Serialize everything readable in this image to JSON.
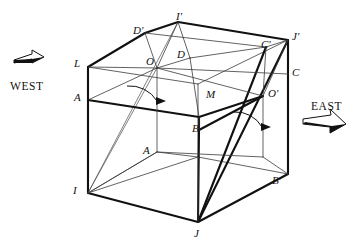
{
  "figure": {
    "type": "geometric-line-diagram",
    "background_color": "#ffffff",
    "stroke_color": "#111111"
  },
  "direction_markers": [
    {
      "id": "west",
      "label": "WEST",
      "icon": "arrow-right-3d",
      "x": 10,
      "y": 81,
      "arrow_x": 14,
      "arrow_y": 56,
      "arrow_dir": "right"
    },
    {
      "id": "east",
      "label": "EAST",
      "icon": "arrow-down-right-3d",
      "x": 311,
      "y": 101,
      "arrow_x": 303,
      "arrow_y": 118,
      "arrow_dir": "down-right"
    }
  ],
  "vertex_labels": [
    {
      "id": "D-prime",
      "text": "D'",
      "x": 133,
      "y": 25
    },
    {
      "id": "I-prime",
      "text": "I'",
      "x": 176,
      "y": 11
    },
    {
      "id": "J-prime",
      "text": "J'",
      "x": 292,
      "y": 31
    },
    {
      "id": "C-prime",
      "text": "C'",
      "x": 261,
      "y": 39
    },
    {
      "id": "D",
      "text": "D",
      "x": 177,
      "y": 49
    },
    {
      "id": "O",
      "text": "O",
      "x": 146,
      "y": 56
    },
    {
      "id": "L",
      "text": "L",
      "x": 74,
      "y": 58
    },
    {
      "id": "C",
      "text": "C",
      "x": 292,
      "y": 67
    },
    {
      "id": "M",
      "text": "M",
      "x": 206,
      "y": 89
    },
    {
      "id": "O-prime",
      "text": "O'",
      "x": 268,
      "y": 88
    },
    {
      "id": "A-upper",
      "text": "A",
      "x": 74,
      "y": 92
    },
    {
      "id": "B",
      "text": "B",
      "x": 192,
      "y": 123
    },
    {
      "id": "A-lower",
      "text": "A",
      "x": 143,
      "y": 145
    },
    {
      "id": "B-prime",
      "text": "B'",
      "x": 272,
      "y": 175
    },
    {
      "id": "I",
      "text": "I",
      "x": 73,
      "y": 185
    },
    {
      "id": "J",
      "text": "J",
      "x": 194,
      "y": 228
    }
  ],
  "points": {
    "L": [
      88,
      67
    ],
    "Dp": [
      145,
      33
    ],
    "Ip": [
      178,
      22
    ],
    "Jp": [
      288,
      40
    ],
    "Cp": [
      266,
      47
    ],
    "O": [
      157,
      68
    ],
    "D": [
      190,
      58
    ],
    "A": [
      88,
      100
    ],
    "M": [
      199,
      98
    ],
    "Op": [
      263,
      96
    ],
    "C": [
      288,
      74
    ],
    "B": [
      199,
      130
    ],
    "Alo": [
      157,
      152
    ],
    "I": [
      88,
      193
    ],
    "J": [
      198,
      222
    ],
    "Bp": [
      288,
      174
    ],
    "Bback": [
      263,
      157
    ],
    "Lb": [
      109,
      47
    ]
  },
  "angles": [
    {
      "id": "angle-at-O",
      "vertex": "O",
      "arc_radius": 32,
      "has_arrowhead": true
    },
    {
      "id": "angle-at-O-prime",
      "vertex": "O-prime",
      "arc_radius": 30,
      "has_arrowhead": true
    }
  ]
}
